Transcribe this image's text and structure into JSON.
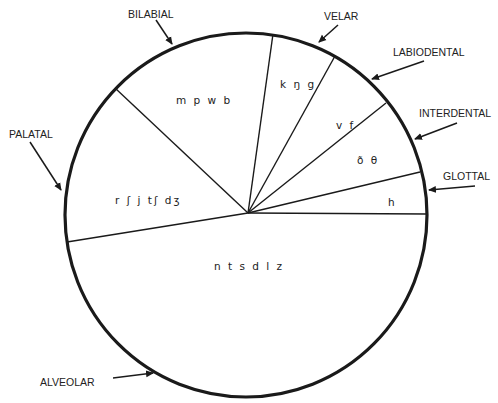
{
  "diagram": {
    "type": "pie-style place-of-articulation diagram",
    "colors": {
      "stroke": "#1a1a1a",
      "background": "#ffffff",
      "text": "#222222"
    },
    "regions": [
      {
        "id": "bilabial",
        "label": "BILABIAL",
        "sounds": "m p w b"
      },
      {
        "id": "velar",
        "label": "VELAR",
        "sounds": "k ŋ g"
      },
      {
        "id": "labiodental",
        "label": "LABIODENTAL",
        "sounds": "v f"
      },
      {
        "id": "interdental",
        "label": "INTERDENTAL",
        "sounds": "ð θ"
      },
      {
        "id": "glottal",
        "label": "GLOTTAL",
        "sounds": "h"
      },
      {
        "id": "palatal",
        "label": "PALATAL",
        "sounds": "r ʃ j tʃ dʒ"
      },
      {
        "id": "alveolar",
        "label": "ALVEOLAR",
        "sounds": "n t s d l z"
      }
    ]
  }
}
